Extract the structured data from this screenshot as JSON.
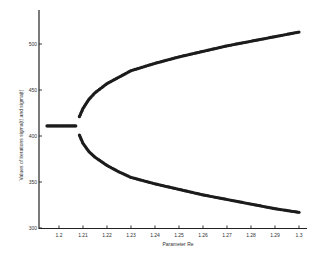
{
  "chart_data": {
    "type": "scatter",
    "title": "",
    "xlabel": "Parameter Re",
    "ylabel": "Values of iterations sigma(t) and sigma(t)",
    "xlim": [
      1.1935,
      1.305
    ],
    "ylim": [
      300,
      520
    ],
    "x_ticks": [
      1.2,
      1.21,
      1.22,
      1.23,
      1.24,
      1.25,
      1.26,
      1.27,
      1.28,
      1.29,
      1.3
    ],
    "x_tick_labels": [
      "1.2",
      "1.21",
      "1.22",
      "1.23",
      "1.24",
      "1.25",
      "1.26",
      "1.27",
      "1.28",
      "1.29",
      "1.3"
    ],
    "y_ticks": [
      300,
      350,
      400,
      450,
      500
    ],
    "y_tick_labels": [
      "300",
      "350",
      "400",
      "450",
      "500"
    ],
    "grid": false,
    "legend": null,
    "series": [
      {
        "name": "stable fixed point",
        "x": [
          1.195,
          1.197,
          1.199,
          1.201,
          1.203,
          1.205,
          1.207
        ],
        "y": [
          411,
          411,
          411,
          411,
          411,
          411,
          411
        ]
      },
      {
        "name": "upper branch",
        "x": [
          1.2085,
          1.21,
          1.2125,
          1.215,
          1.22,
          1.225,
          1.23,
          1.24,
          1.25,
          1.26,
          1.27,
          1.28,
          1.29,
          1.3
        ],
        "y": [
          421,
          430,
          440,
          447,
          457,
          464,
          471,
          479,
          486,
          492,
          498,
          503,
          508,
          513
        ]
      },
      {
        "name": "lower branch",
        "x": [
          1.2085,
          1.21,
          1.2125,
          1.215,
          1.22,
          1.225,
          1.23,
          1.24,
          1.25,
          1.26,
          1.27,
          1.28,
          1.29,
          1.3
        ],
        "y": [
          401,
          392,
          383,
          377,
          368,
          361,
          355,
          348,
          342,
          336,
          331,
          326,
          321,
          317
        ]
      }
    ]
  }
}
